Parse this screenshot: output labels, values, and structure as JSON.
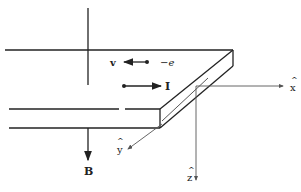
{
  "diagram": {
    "type": "hall-effect-slab",
    "labels": {
      "velocity": "v",
      "electron": "−e",
      "current": "I",
      "field": "B",
      "x_axis": "x",
      "y_axis": "y",
      "z_axis": "z",
      "hat": "^"
    },
    "colors": {
      "line": "#222222",
      "axis": "#555555",
      "background": "#ffffff"
    }
  }
}
